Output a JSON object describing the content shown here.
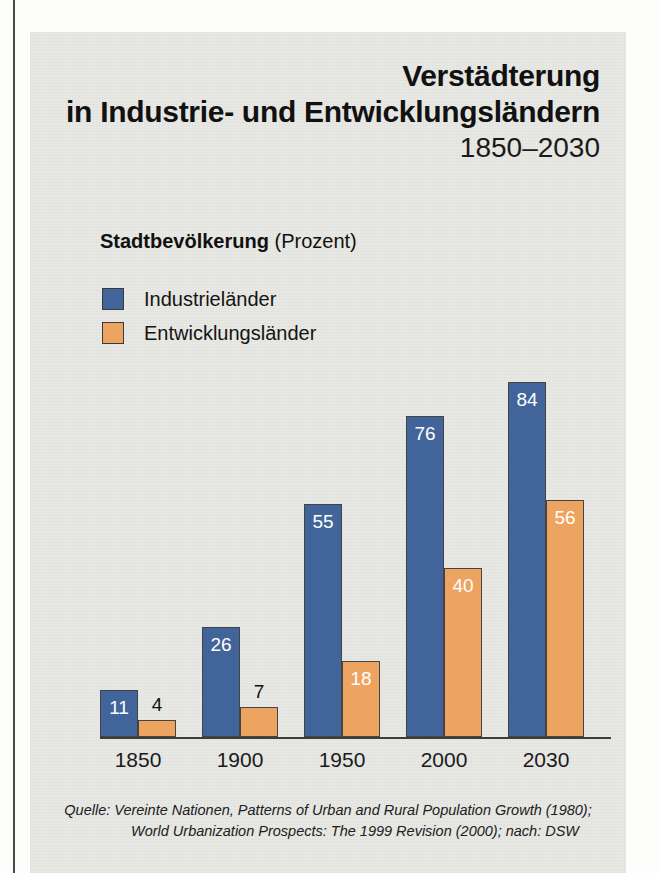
{
  "page": {
    "background": "#fdfdfc",
    "panel_color": "#e8e8e4"
  },
  "title": {
    "line1": "Verstädterung",
    "line2": "in Industrie- und Entwicklungsländern",
    "range": "1850–2030"
  },
  "subtitle": {
    "strong": "Stadtbevölkerung",
    "unit": "(Prozent)"
  },
  "legend": {
    "items": [
      {
        "label": "Industrieländer",
        "color": "#41659b"
      },
      {
        "label": "Entwicklungsländer",
        "color": "#eda461"
      }
    ]
  },
  "source": {
    "line1": "Quelle: Vereinte Nationen, Patterns of Urban and Rural Population Growth (1980);",
    "line2": "World Urbanization Prospects: The 1999 Revision (2000); nach: DSW"
  },
  "chart_data": {
    "type": "bar",
    "title": "Verstädterung in Industrie- und Entwicklungsländern 1850–2030",
    "subtitle": "Stadtbevölkerung (Prozent)",
    "xlabel": "",
    "ylabel": "Stadtbevölkerung (Prozent)",
    "ylim": [
      0,
      100
    ],
    "grid": false,
    "legend_position": "top-left",
    "categories": [
      "1850",
      "1900",
      "1950",
      "2000",
      "2030"
    ],
    "series": [
      {
        "name": "Industrieländer",
        "color": "#41659b",
        "values": [
          11,
          26,
          55,
          76,
          84
        ]
      },
      {
        "name": "Entwicklungsländer",
        "color": "#eda461",
        "values": [
          4,
          7,
          18,
          40,
          56
        ]
      }
    ],
    "value_labels": {
      "Industrieländer": [
        "11",
        "26",
        "55",
        "76",
        "84"
      ],
      "Entwicklungsländer": [
        "4",
        "7",
        "18",
        "40",
        "56"
      ]
    }
  }
}
